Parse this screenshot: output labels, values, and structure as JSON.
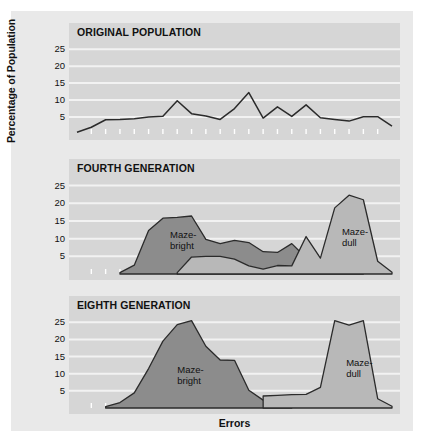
{
  "figure": {
    "ylabel": "Percentage of Population",
    "xlabel": "Errors",
    "colors": {
      "page_background": "#ffffff",
      "figure_background": "#e9e9e9",
      "plot_background": "#d6d6d6",
      "gridline": "#f2f2f2",
      "maze_bright_fill": "#8c8c8c",
      "maze_dull_fill": "#b8b8b8",
      "line": "#2b2b2b",
      "text": "#111111"
    }
  },
  "chart_data": {
    "type": "area",
    "xlabel": "Errors",
    "ylabel": "Percentage of Population",
    "ylim": [
      0,
      28
    ],
    "yticks": [
      5,
      10,
      15,
      20,
      25
    ],
    "xlim": [
      0,
      22
    ],
    "grid": true,
    "legend": "inline-annotations",
    "panels": [
      {
        "title": "ORIGINAL POPULATION",
        "series": [
          {
            "name": "Original population",
            "style": "line",
            "x": [
              0,
              1,
              2,
              3,
              4,
              5,
              6,
              7,
              8,
              9,
              10,
              11,
              12,
              13,
              14,
              15,
              16,
              17,
              18,
              19,
              20,
              21,
              22
            ],
            "values": [
              0.5,
              2.0,
              4.2,
              4.3,
              4.5,
              5.0,
              5.2,
              9.8,
              6.0,
              5.3,
              4.3,
              7.5,
              12.2,
              4.7,
              8.0,
              5.2,
              8.6,
              4.8,
              4.3,
              3.8,
              5.1,
              5.1,
              2.3,
              1.2
            ]
          }
        ],
        "annotations": []
      },
      {
        "title": "FOURTH GENERATION",
        "series": [
          {
            "name": "Maze-bright",
            "style": "area",
            "fill": "#8c8c8c",
            "x": [
              3,
              4,
              5,
              6,
              7,
              8,
              9,
              10,
              11,
              12,
              13,
              14,
              15,
              16,
              17,
              18,
              19,
              20
            ],
            "values": [
              0.4,
              2.5,
              12.3,
              15.8,
              16.0,
              16.4,
              9.8,
              8.6,
              9.5,
              8.9,
              6.3,
              6.1,
              8.6,
              4.6,
              4.6,
              2.8,
              4.1,
              0.4
            ]
          },
          {
            "name": "Maze-dull",
            "style": "area",
            "fill": "#b8b8b8",
            "x": [
              7,
              8,
              9,
              10,
              11,
              12,
              13,
              14,
              15,
              16,
              17,
              18,
              19,
              20,
              21,
              22
            ],
            "values": [
              0.4,
              4.8,
              5.0,
              5.0,
              4.2,
              2.3,
              1.4,
              2.4,
              2.3,
              10.6,
              4.5,
              18.7,
              22.3,
              21.0,
              3.6,
              0.5
            ]
          }
        ],
        "annotations": [
          {
            "text_line1": "Maze-",
            "text_line2": "bright",
            "x": 6.5,
            "y": 11
          },
          {
            "text_line1": "Maze-",
            "text_line2": "dull",
            "x": 18.5,
            "y": 12
          }
        ]
      },
      {
        "title": "EIGHTH GENERATION",
        "series": [
          {
            "name": "Maze-bright",
            "style": "area",
            "fill": "#8c8c8c",
            "x": [
              2,
              3,
              4,
              5,
              6,
              7,
              8,
              9,
              10,
              11,
              12,
              13,
              14,
              15
            ],
            "values": [
              0.4,
              1.6,
              4.4,
              11.5,
              19.5,
              24.3,
              25.5,
              18.0,
              14.0,
              13.9,
              5.2,
              2.3,
              3.6,
              0.4
            ]
          },
          {
            "name": "Maze-dull",
            "style": "area",
            "fill": "#b8b8b8",
            "x": [
              13,
              14,
              15,
              16,
              17,
              18,
              19,
              20,
              21,
              22
            ],
            "values": [
              3.5,
              3.7,
              3.9,
              4.0,
              6.0,
              25.5,
              24.2,
              25.5,
              2.7,
              0.5
            ]
          }
        ],
        "annotations": [
          {
            "text_line1": "Maze-",
            "text_line2": "bright",
            "x": 7.0,
            "y": 11
          },
          {
            "text_line1": "Maze-",
            "text_line2": "dull",
            "x": 18.8,
            "y": 13
          }
        ]
      }
    ]
  }
}
